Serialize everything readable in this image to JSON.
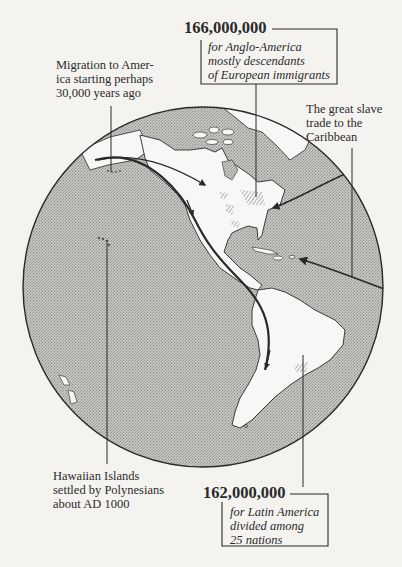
{
  "colors": {
    "background": "#f4f3f0",
    "ocean": "#b9b9b6",
    "land": "#f7f7f5",
    "ink": "#2a2a2a"
  },
  "callouts": {
    "anglo_america": {
      "figure": "166,000,000",
      "lines": [
        "for Anglo-America",
        "mostly descendants",
        "of European immigrants"
      ]
    },
    "migration": {
      "lines": [
        "Migration to Amer-",
        "ica starting perhaps",
        "30,000 years ago"
      ]
    },
    "slave_trade": {
      "lines": [
        "The great slave",
        "trade to the",
        "Caribbean"
      ]
    },
    "hawaii": {
      "lines": [
        "Hawaiian Islands",
        "settled by Polynesians",
        "about AD 1000"
      ]
    },
    "latin_america": {
      "figure": "162,000,000",
      "lines": [
        "for Latin America",
        "divided among",
        "25 nations"
      ]
    }
  }
}
